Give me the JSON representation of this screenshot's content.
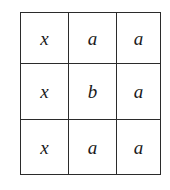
{
  "figure": {
    "name": "matrix-grid",
    "rows": 3,
    "columns": 3,
    "border_color": "#2b2b2b",
    "background_color": "#ffffff",
    "text_color": "#1a1a1a",
    "cells": [
      [
        {
          "text": "x"
        },
        {
          "text": "a"
        },
        {
          "text": "a"
        }
      ],
      [
        {
          "text": "x"
        },
        {
          "text": "b"
        },
        {
          "text": "a"
        }
      ],
      [
        {
          "text": "x"
        },
        {
          "text": "a"
        },
        {
          "text": "a"
        }
      ]
    ]
  }
}
